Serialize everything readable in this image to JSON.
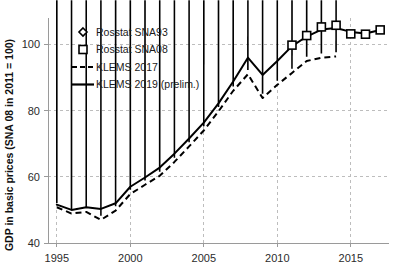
{
  "chart_data": {
    "type": "line",
    "title": "",
    "subtitle": "",
    "xlabel": "",
    "ylabel": "GDP in basic prices (SNA 08 in 2011 = 100)",
    "xlim": [
      1994.4,
      2017.6
    ],
    "ylim": [
      40,
      108
    ],
    "xticks": [
      1995,
      2000,
      2005,
      2010,
      2015
    ],
    "xtick_labels": [
      "1995",
      "2000",
      "2005",
      "2010",
      "2015"
    ],
    "yticks": [
      40,
      60,
      80,
      100
    ],
    "ytick_labels": [
      "40",
      "60",
      "80",
      "100"
    ],
    "grid": "dashed gridlines on both axes at major ticks",
    "legend_position": "upper left inside plot area",
    "series": [
      {
        "name": "Rosstat SNA93",
        "marker": "diamond",
        "line": "none",
        "x": [
          1995,
          1996,
          1997,
          1998,
          1999,
          2000,
          2001,
          2002,
          2003,
          2004,
          2005,
          2006,
          2007,
          2008,
          2009,
          2010,
          2011,
          2012,
          2013,
          2014
        ],
        "values": [
          50.8,
          48.9,
          49.4,
          47.0,
          49.8,
          54.8,
          57.6,
          60.3,
          64.5,
          69.2,
          74.0,
          79.8,
          86.0,
          91.0,
          83.8,
          87.8,
          91.4,
          95.0,
          96.0,
          96.4
        ]
      },
      {
        "name": "Rosstat SNA08",
        "marker": "square",
        "line": "none",
        "x": [
          2011,
          2012,
          2013,
          2014,
          2015,
          2016,
          2017
        ],
        "values": [
          99.8,
          102.7,
          105.3,
          105.8,
          103.2,
          103.1,
          104.4
        ]
      },
      {
        "name": "KLEMS 2017",
        "marker": "none",
        "line": "dashed",
        "x": [
          1995,
          1996,
          1997,
          1998,
          1999,
          2000,
          2001,
          2002,
          2003,
          2004,
          2005,
          2006,
          2007,
          2008,
          2009,
          2010,
          2011,
          2012,
          2013,
          2014
        ],
        "values": [
          50.8,
          48.9,
          49.4,
          47.0,
          49.8,
          54.8,
          57.6,
          60.3,
          64.5,
          69.2,
          74.0,
          79.8,
          86.0,
          91.0,
          83.8,
          87.8,
          91.4,
          95.0,
          96.0,
          96.4
        ]
      },
      {
        "name": "KLEMS 2019 (prelim.)",
        "marker": "none",
        "line": "solid",
        "x": [
          1995,
          1996,
          1997,
          1998,
          1999,
          2000,
          2001,
          2002,
          2003,
          2004,
          2005,
          2006,
          2007,
          2008,
          2009,
          2010,
          2011,
          2012,
          2013,
          2014,
          2015,
          2016,
          2017
        ],
        "values": [
          51.6,
          50.0,
          50.8,
          50.3,
          52.0,
          57.0,
          59.8,
          62.8,
          67.0,
          71.6,
          76.4,
          82.2,
          88.8,
          96.0,
          90.8,
          95.0,
          99.5,
          102.4,
          104.5,
          105.0,
          103.8,
          103.3,
          104.4
        ]
      }
    ],
    "legend_entries": [
      {
        "label": "Rosstat SNA93",
        "style": "diamond-marker"
      },
      {
        "label": "Rosstat SNA08",
        "style": "square-marker"
      },
      {
        "label": "KLEMS 2017",
        "style": "dashed-line"
      },
      {
        "label": "KLEMS 2019 (prelim.)",
        "style": "solid-line"
      }
    ],
    "colors": {
      "series": "#000000",
      "grid": "#bdbdbd",
      "axis": "#9a9a9a",
      "text": "#1a1a1a",
      "background": "#ffffff"
    }
  }
}
